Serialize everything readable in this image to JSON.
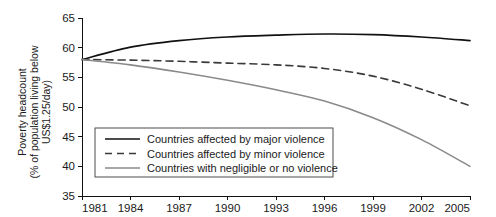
{
  "chart_data": {
    "type": "line",
    "title": "",
    "xlabel": "",
    "ylabel": "Poverty headcount (% of population living below US$1.25/day)",
    "ylabel_line1": "Poverty headcount",
    "ylabel_line2": "(% of population living below",
    "ylabel_line3": "US$1.25/day)",
    "xlim": [
      1981,
      2005
    ],
    "ylim": [
      35,
      65
    ],
    "grid": false,
    "legend_position": "lower-left-inside",
    "xticks": [
      1981,
      1984,
      1987,
      1990,
      1993,
      1996,
      1999,
      2002,
      2005
    ],
    "xtick_labels": [
      "1981",
      "1984",
      "1987",
      "1990",
      "1993",
      "1996",
      "1999",
      "2002",
      "2005"
    ],
    "yticks": [
      35,
      40,
      45,
      50,
      55,
      60,
      65
    ],
    "ytick_labels": [
      "35",
      "40",
      "45",
      "50",
      "55",
      "60",
      "65"
    ],
    "x": [
      1981,
      1984,
      1987,
      1990,
      1993,
      1996,
      1999,
      2002,
      2005
    ],
    "series": [
      {
        "name": "Countries affected by major violence",
        "style": "solid",
        "color": "#111111",
        "width": 1.7,
        "values": [
          58.0,
          60.1,
          61.2,
          61.8,
          62.1,
          62.3,
          62.2,
          61.8,
          61.2
        ]
      },
      {
        "name": "Countries affected by minor violence",
        "style": "dashed",
        "color": "#3a3a3a",
        "width": 1.6,
        "values": [
          58.0,
          57.9,
          57.7,
          57.4,
          57.1,
          56.5,
          55.2,
          53.0,
          50.2
        ]
      },
      {
        "name": "Countries with negligible or no violence",
        "style": "solid",
        "color": "#8a8a8a",
        "width": 1.6,
        "values": [
          58.0,
          57.1,
          55.9,
          54.5,
          52.9,
          51.0,
          48.2,
          44.5,
          40.0
        ]
      }
    ]
  },
  "legend": {
    "entries": [
      {
        "label": "Countries affected by major violence",
        "style": "solid",
        "color": "#111111"
      },
      {
        "label": "Countries affected by minor violence",
        "style": "dashed",
        "color": "#3a3a3a"
      },
      {
        "label": "Countries with negligible or no violence",
        "style": "solid",
        "color": "#8a8a8a"
      }
    ]
  }
}
